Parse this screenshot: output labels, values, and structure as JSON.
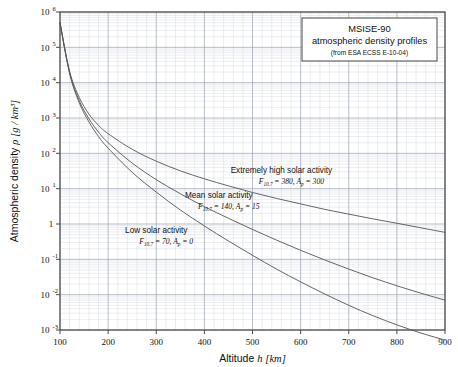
{
  "chart_data": {
    "type": "line",
    "title_box": {
      "line1": "MSISE-90",
      "line2": "atmospheric density profiles",
      "line3": "(from ESA ECSS E-10-04)"
    },
    "xlabel": "Altitude",
    "xlabel_symbol": "h",
    "xlabel_unit": "[km]",
    "ylabel": "Atmospheric density",
    "ylabel_symbol": "ρ",
    "ylabel_unit": "[g / km³]",
    "xlim": [
      100,
      900
    ],
    "ylim": [
      0.001,
      1000000
    ],
    "yscale": "log",
    "xscale": "linear",
    "grid": true,
    "grid_minor": true,
    "legend_position": "inline-annotations",
    "x_ticks": [
      100,
      200,
      300,
      400,
      500,
      600,
      700,
      800,
      900
    ],
    "x_tick_labels": [
      "100",
      "200",
      "300",
      "400",
      "500",
      "600",
      "700",
      "800",
      "900"
    ],
    "y_ticks": [
      0.001,
      0.01,
      0.1,
      1,
      10,
      100,
      1000,
      10000,
      100000,
      1000000
    ],
    "y_tick_labels": [
      {
        "mantissa": "10",
        "exponent": "-3"
      },
      {
        "mantissa": "10",
        "exponent": "-2"
      },
      {
        "mantissa": "10",
        "exponent": "-1"
      },
      {
        "mantissa": "1",
        "exponent": ""
      },
      {
        "mantissa": "10",
        "exponent": "1"
      },
      {
        "mantissa": "10",
        "exponent": "2"
      },
      {
        "mantissa": "10",
        "exponent": "3"
      },
      {
        "mantissa": "10",
        "exponent": "4"
      },
      {
        "mantissa": "10",
        "exponent": "5"
      },
      {
        "mantissa": "10",
        "exponent": "6"
      }
    ],
    "x": [
      100,
      120,
      140,
      160,
      180,
      200,
      250,
      300,
      350,
      400,
      450,
      500,
      550,
      600,
      650,
      700,
      750,
      800,
      850,
      900
    ],
    "series": [
      {
        "name": "Extremely high solar activity",
        "label_line1": "Extremely high solar activity",
        "label_line2_parts": {
          "f_symbol": "F",
          "f_sub": "10.7",
          "f_value": "380",
          "a_symbol": "A",
          "a_sub": "p",
          "a_value": "300"
        },
        "f107": 380,
        "ap": 300,
        "color": "#555555",
        "values": [
          497000,
          21000,
          3800,
          1300,
          620,
          360,
          130,
          60,
          32,
          19,
          12,
          7.8,
          5.3,
          3.7,
          2.6,
          1.9,
          1.4,
          1.05,
          0.78,
          0.58
        ]
      },
      {
        "name": "Mean solar activity",
        "label_line1": "Mean solar activity",
        "label_line2_parts": {
          "f_symbol": "F",
          "f_sub": "10.7",
          "f_value": "140",
          "a_symbol": "A",
          "a_sub": "p",
          "a_value": "15"
        },
        "f107": 140,
        "ap": 15,
        "color": "#555555",
        "values": [
          497000,
          19000,
          3100,
          960,
          400,
          200,
          53,
          18,
          7.2,
          3.1,
          1.45,
          0.7,
          0.35,
          0.18,
          0.096,
          0.053,
          0.03,
          0.0178,
          0.011,
          0.007
        ]
      },
      {
        "name": "Low solar activity",
        "label_line1": "Low solar activity",
        "label_line2_parts": {
          "f_symbol": "F",
          "f_sub": "10.7",
          "f_value": "70",
          "a_symbol": "A",
          "a_sub": "p",
          "a_value": "0"
        },
        "f107": 70,
        "ap": 0,
        "color": "#555555",
        "values": [
          497000,
          18000,
          2700,
          780,
          300,
          140,
          29,
          8.0,
          2.5,
          0.88,
          0.33,
          0.13,
          0.053,
          0.023,
          0.0105,
          0.005,
          0.00255,
          0.0014,
          0.00082,
          0.00052
        ]
      }
    ],
    "annotations": [
      {
        "text": "Extremely high solar activity",
        "x_km": 560,
        "y_value": 28
      },
      {
        "text": "Mean solar activity",
        "x_km": 430,
        "y_value": 5.5
      },
      {
        "text": "Low solar activity",
        "x_km": 300,
        "y_value": 0.55
      }
    ],
    "style": {
      "frame_color": "#4a4a4a",
      "grid_major_color": "#9aa0b0",
      "grid_minor_color": "#d7dae2",
      "background": "#ffffff",
      "curve_color": "#555555"
    }
  }
}
